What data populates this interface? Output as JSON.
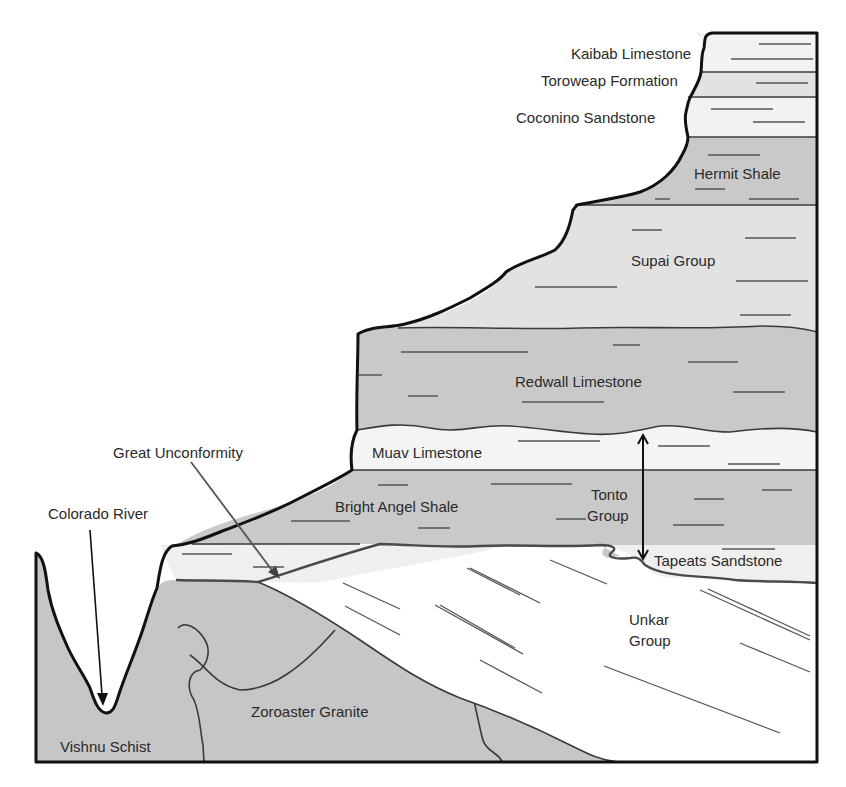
{
  "diagram": {
    "colors": {
      "light_layer": "#efefef",
      "medium_layer": "#e2e2e2",
      "dark_layer": "#c9c9c9",
      "basement": "#c6c6c6",
      "unkar": "#ffffff",
      "outline": "#111111",
      "text": "#2a2a2a"
    },
    "layers": [
      {
        "id": "kaibab",
        "label": "Kaibab Limestone"
      },
      {
        "id": "toroweap",
        "label": "Toroweap Formation"
      },
      {
        "id": "coconino",
        "label": "Coconino Sandstone"
      },
      {
        "id": "hermit",
        "label": "Hermit Shale"
      },
      {
        "id": "supai",
        "label": "Supai Group"
      },
      {
        "id": "redwall",
        "label": "Redwall Limestone"
      },
      {
        "id": "muav",
        "label": "Muav Limestone"
      },
      {
        "id": "bright_angel",
        "label": "Bright Angel Shale"
      },
      {
        "id": "tapeats",
        "label": "Tapeats Sandstone"
      },
      {
        "id": "unkar_line1",
        "label": "Unkar"
      },
      {
        "id": "unkar_line2",
        "label": "Group"
      },
      {
        "id": "zoroaster",
        "label": "Zoroaster Granite"
      },
      {
        "id": "vishnu",
        "label": "Vishnu Schist"
      }
    ],
    "annotations": {
      "tonto_line1": "Tonto",
      "tonto_line2": "Group",
      "great_unconformity": "Great Unconformity",
      "colorado_river": "Colorado River"
    },
    "arrows": [
      {
        "id": "tonto-range-arrow",
        "type": "double-headed",
        "from": "Muav Limestone top",
        "to": "Tapeats Sandstone base"
      },
      {
        "id": "great-unconformity-arrow",
        "type": "pointer",
        "target": "Tapeats / Unkar contact"
      },
      {
        "id": "colorado-river-arrow",
        "type": "pointer",
        "target": "canyon floor river"
      }
    ]
  }
}
